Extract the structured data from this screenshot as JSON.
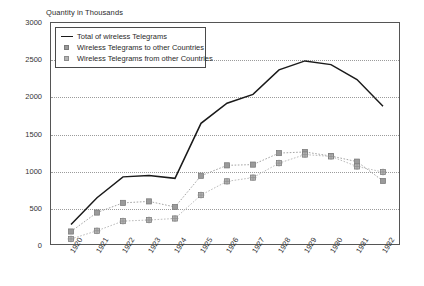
{
  "axis_title": "Quantity in Thousands",
  "legend": {
    "items": [
      {
        "label": "Total of wireless Telegrams",
        "marker": "line",
        "color": "#1a1a1a"
      },
      {
        "label": "Wireless Telegrams to other Countries",
        "marker": "square",
        "color": "#9a9a9a"
      },
      {
        "label": "Wireless Telegrams from other Countries",
        "marker": "plus-square",
        "color": "#b4b4b4"
      }
    ]
  },
  "chart_data": {
    "type": "line",
    "title": "",
    "subtitle": "",
    "xlabel": "",
    "ylabel": "Quantity in Thousands",
    "ylim": [
      0,
      3000
    ],
    "yticks": [
      0,
      500,
      1000,
      1500,
      2000,
      2500,
      3000
    ],
    "ytick_labels": [
      "0",
      "500",
      "1000",
      "1500",
      "2000",
      "2500",
      "3000"
    ],
    "grid": true,
    "grid_style": "dotted-horizontal",
    "legend_position": "top-left-inside",
    "categories": [
      "1920",
      "1921",
      "1922",
      "1923",
      "1924",
      "1925",
      "1926",
      "1927",
      "1928",
      "1929",
      "1930",
      "1931",
      "1932"
    ],
    "x": [
      1920,
      1921,
      1922,
      1923,
      1924,
      1925,
      1926,
      1927,
      1928,
      1929,
      1930,
      1931,
      1932
    ],
    "series": [
      {
        "name": "Total of wireless Telegrams",
        "marker": "none",
        "color": "#1a1a1a",
        "values": [
          290,
          650,
          930,
          950,
          910,
          1650,
          1920,
          2040,
          2370,
          2490,
          2440,
          2240,
          1880
        ]
      },
      {
        "name": "Wireless Telegrams to other Countries",
        "marker": "square",
        "color": "#9a9a9a",
        "values": [
          195,
          450,
          580,
          600,
          525,
          945,
          1085,
          1095,
          1250,
          1265,
          1210,
          1135,
          875
        ]
      },
      {
        "name": "Wireless Telegrams from other Countries",
        "marker": "plus-square",
        "color": "#b4b4b4",
        "values": [
          95,
          205,
          335,
          350,
          370,
          685,
          870,
          920,
          1115,
          1230,
          1205,
          1070,
          995
        ]
      }
    ]
  }
}
